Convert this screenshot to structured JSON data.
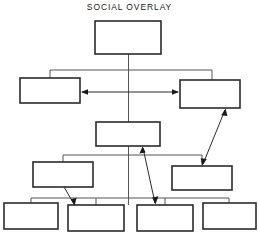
{
  "diagram": {
    "title": "SOCIAL OVERLAY",
    "type": "hierarchy-chart",
    "background_color": "#ffffff",
    "box_stroke_color": "#2b2b2b",
    "connector_color": "#555555",
    "arrow_color": "#1a1a1a",
    "nodes": [
      {
        "id": "n-root",
        "label": "",
        "row": 1,
        "x": 95,
        "y": 21,
        "w": 66,
        "h": 33
      },
      {
        "id": "n-row2-left",
        "label": "",
        "row": 2,
        "x": 20,
        "y": 78,
        "w": 60,
        "h": 25
      },
      {
        "id": "n-row2-right",
        "label": "",
        "row": 2,
        "x": 180,
        "y": 80,
        "w": 60,
        "h": 28
      },
      {
        "id": "n-row3-mid",
        "label": "",
        "row": 3,
        "x": 96,
        "y": 122,
        "w": 64,
        "h": 24
      },
      {
        "id": "n-row4-left",
        "label": "",
        "row": 4,
        "x": 33,
        "y": 162,
        "w": 60,
        "h": 25
      },
      {
        "id": "n-row4-right",
        "label": "",
        "row": 4,
        "x": 172,
        "y": 166,
        "w": 60,
        "h": 24
      },
      {
        "id": "n-row5-1",
        "label": "",
        "row": 5,
        "x": 4,
        "y": 203,
        "w": 54,
        "h": 26
      },
      {
        "id": "n-row5-2",
        "label": "",
        "row": 5,
        "x": 68,
        "y": 205,
        "w": 56,
        "h": 26
      },
      {
        "id": "n-row5-3",
        "label": "",
        "row": 5,
        "x": 137,
        "y": 205,
        "w": 56,
        "h": 26
      },
      {
        "id": "n-row5-4",
        "label": "",
        "row": 5,
        "x": 203,
        "y": 203,
        "w": 53,
        "h": 26
      }
    ],
    "connectors": [
      {
        "id": "c-trunk",
        "kind": "vertical-trunk",
        "from": "n-root",
        "to": "n-row3-mid"
      },
      {
        "id": "c-row2-bracket",
        "kind": "bracket",
        "from": "n-root",
        "to": [
          "n-row2-left",
          "n-row2-right"
        ]
      },
      {
        "id": "c-row4-bracket",
        "kind": "bracket",
        "from": "n-row3-mid",
        "to": [
          "n-row4-left",
          "n-row4-right"
        ]
      },
      {
        "id": "c-row5-bracket",
        "kind": "bracket",
        "from": "n-row3-mid",
        "to": [
          "n-row5-1",
          "n-row5-2",
          "n-row5-3",
          "n-row5-4"
        ]
      }
    ],
    "arrows": [
      {
        "id": "a-row2-pair",
        "kind": "double-headed-horizontal",
        "from": "n-row2-left",
        "to": "n-row2-right"
      },
      {
        "id": "a-right-cross",
        "kind": "double-headed-diagonal",
        "from": "n-row2-right",
        "to": "n-row4-right"
      },
      {
        "id": "a-mid-cross",
        "kind": "double-headed-diagonal",
        "from": "n-row3-mid",
        "to": "n-row5-3"
      },
      {
        "id": "a-left-down",
        "kind": "single-headed-diagonal",
        "from": "n-row4-left",
        "to": "n-row5-2"
      }
    ]
  }
}
